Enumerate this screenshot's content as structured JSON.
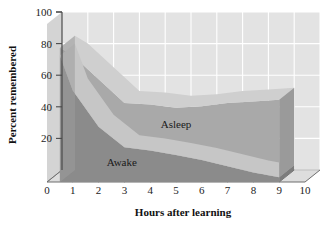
{
  "chart_data": {
    "type": "area",
    "title": "",
    "xlabel": "Hours after learning",
    "ylabel": "Percent remembered",
    "xlim": [
      0,
      10
    ],
    "ylim": [
      0,
      100
    ],
    "xticks": [
      "0",
      "1",
      "2",
      "3",
      "4",
      "5",
      "6",
      "7",
      "8",
      "9",
      "10"
    ],
    "yticks": [
      "20",
      "40",
      "60",
      "80",
      "100"
    ],
    "grid": true,
    "legend_position": "inline-annotations",
    "style": "3d-stacked-area",
    "x": [
      0.5,
      1,
      2,
      3,
      4,
      5,
      6,
      7,
      8,
      9
    ],
    "series": [
      {
        "name": "Asleep",
        "label": "Asleep",
        "color": "#a9a9a9",
        "values": [
          85,
          80,
          65,
          50,
          49,
          47,
          48,
          50,
          51,
          52
        ]
      },
      {
        "name": "Awake",
        "label": "Awake",
        "color": "#8b8b8b",
        "values": [
          80,
          58,
          35,
          22,
          20,
          17,
          14,
          10,
          6,
          3
        ]
      }
    ],
    "annotations": [
      {
        "text": "Asleep",
        "x": 5.0,
        "y": 34
      },
      {
        "text": "Awake",
        "x": 2.9,
        "y": 10
      }
    ],
    "colors": {
      "background": "#ffffff",
      "wall": "#e2e2e2",
      "wall_side": "#d6d6d6",
      "floor": "#dcdcdc",
      "gridline": "#ffffff",
      "axis": "#4a4a4a",
      "asleep_band": "#a9a9a9",
      "asleep_top": "#cfcfcf",
      "awake_band": "#8b8b8b",
      "awake_top": "#c6c6c6",
      "endcap_asleep": "#9a9a9a",
      "endcap_awake": "#7c7c7c",
      "text": "#1a1a1a"
    }
  }
}
